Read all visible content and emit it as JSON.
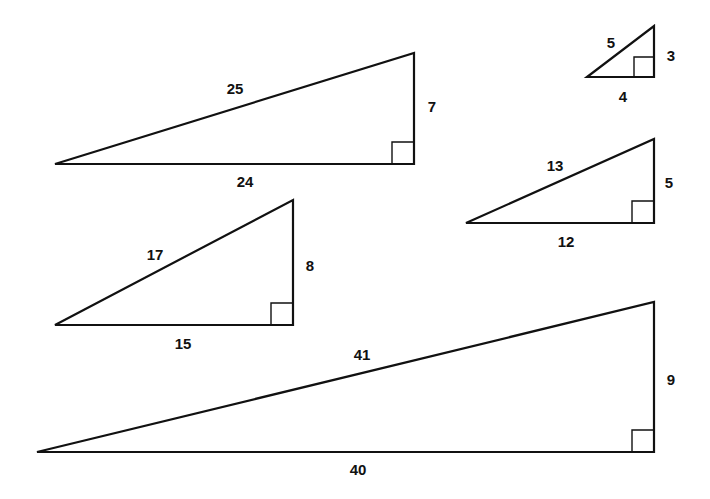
{
  "diagram": {
    "title": "",
    "line_color": "#111111",
    "triangles": [
      {
        "id": "t-7-24-25",
        "legs": {
          "vertical": "7",
          "horizontal": "24"
        },
        "hypotenuse": "25",
        "points": {
          "tip": [
            55,
            164
          ],
          "right_angle": [
            414,
            164
          ],
          "top": [
            414,
            53
          ]
        },
        "label_pos": {
          "hyp": [
            235,
            88
          ],
          "vert": [
            432,
            106
          ],
          "horiz": [
            245,
            181
          ]
        }
      },
      {
        "id": "t-3-4-5",
        "legs": {
          "vertical": "3",
          "horizontal": "4"
        },
        "hypotenuse": "5",
        "points": {
          "tip": [
            587,
            77
          ],
          "right_angle": [
            654,
            77
          ],
          "top": [
            654,
            26
          ]
        },
        "label_pos": {
          "hyp": [
            611,
            42
          ],
          "vert": [
            671,
            55
          ],
          "horiz": [
            623,
            96
          ]
        }
      },
      {
        "id": "t-5-12-13",
        "legs": {
          "vertical": "5",
          "horizontal": "12"
        },
        "hypotenuse": "13",
        "points": {
          "tip": [
            466,
            223
          ],
          "right_angle": [
            654,
            223
          ],
          "top": [
            654,
            139
          ]
        },
        "label_pos": {
          "hyp": [
            555,
            165
          ],
          "vert": [
            669,
            182
          ],
          "horiz": [
            566,
            241
          ]
        }
      },
      {
        "id": "t-8-15-17",
        "legs": {
          "vertical": "8",
          "horizontal": "15"
        },
        "hypotenuse": "17",
        "points": {
          "tip": [
            55,
            325
          ],
          "right_angle": [
            293,
            325
          ],
          "top": [
            293,
            200
          ]
        },
        "label_pos": {
          "hyp": [
            155,
            254
          ],
          "vert": [
            310,
            265
          ],
          "horiz": [
            183,
            343
          ]
        }
      },
      {
        "id": "t-9-40-41",
        "legs": {
          "vertical": "9",
          "horizontal": "40"
        },
        "hypotenuse": "41",
        "points": {
          "tip": [
            37,
            452
          ],
          "right_angle": [
            654,
            452
          ],
          "top": [
            654,
            302
          ]
        },
        "label_pos": {
          "hyp": [
            362,
            354
          ],
          "vert": [
            671,
            379
          ],
          "horiz": [
            358,
            469
          ]
        }
      }
    ]
  }
}
